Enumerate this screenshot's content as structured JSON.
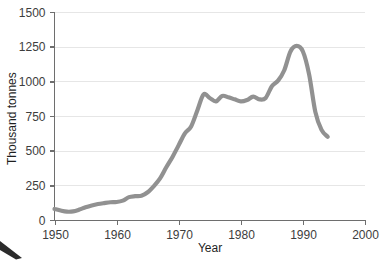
{
  "chart_data": {
    "type": "line",
    "title": "",
    "subtitle": "",
    "xlabel": "Year",
    "ylabel": "Thousand tonnes",
    "xlim": [
      1950,
      2000
    ],
    "ylim": [
      0,
      1500
    ],
    "xticks": [
      1950,
      1960,
      1970,
      1980,
      1990,
      2000
    ],
    "xtick_labels": [
      "1950",
      "1960",
      "1970",
      "1980",
      "1990",
      "2000"
    ],
    "yticks": [
      0,
      250,
      500,
      750,
      1000,
      1250,
      1500
    ],
    "ytick_labels": [
      "0",
      "250",
      "500",
      "750",
      "1000",
      "1250",
      "1500"
    ],
    "grid": "horizontal",
    "legend": "none",
    "line_color": "#919191",
    "series": [
      {
        "name": "Production",
        "x": [
          1950,
          1951,
          1952,
          1953,
          1954,
          1955,
          1956,
          1957,
          1958,
          1959,
          1960,
          1961,
          1962,
          1963,
          1964,
          1965,
          1966,
          1967,
          1968,
          1969,
          1970,
          1971,
          1972,
          1973,
          1974,
          1975,
          1976,
          1977,
          1978,
          1979,
          1980,
          1981,
          1982,
          1983,
          1984,
          1985,
          1986,
          1987,
          1988,
          1989,
          1990,
          1991,
          1992,
          1993,
          1994
        ],
        "values": [
          80,
          68,
          60,
          62,
          75,
          92,
          105,
          115,
          122,
          128,
          130,
          140,
          165,
          172,
          175,
          200,
          245,
          300,
          380,
          455,
          540,
          625,
          675,
          790,
          905,
          880,
          855,
          895,
          885,
          870,
          855,
          865,
          890,
          870,
          880,
          965,
          1005,
          1080,
          1215,
          1255,
          1215,
          1050,
          780,
          650,
          600
        ]
      }
    ],
    "annotations": []
  },
  "axes": {
    "y_axis_title": "Thousand tonnes",
    "x_axis_title": "Year"
  },
  "corner_mark": {
    "name": "page-corner-wedge"
  }
}
